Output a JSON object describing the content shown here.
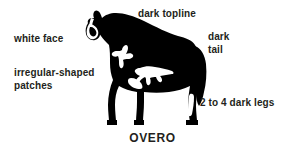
{
  "figure": {
    "title_caption": "OVERO",
    "colors": {
      "ink": "#231f20",
      "silhouette": "#000000",
      "background": "#ffffff",
      "marking": "#ffffff"
    },
    "annotations": [
      {
        "id": "dark-topline",
        "text": "dark topline",
        "anchor": "top-center"
      },
      {
        "id": "white-face",
        "text": "white face",
        "anchor": "left-upper"
      },
      {
        "id": "dark-tail",
        "text": "dark\ntail",
        "anchor": "right-upper"
      },
      {
        "id": "irregular-shaped-patches",
        "text": "irregular-shaped\npatches",
        "anchor": "left-middle"
      },
      {
        "id": "dark-legs",
        "text": "2 to 4 dark legs",
        "anchor": "right-lower"
      }
    ]
  }
}
